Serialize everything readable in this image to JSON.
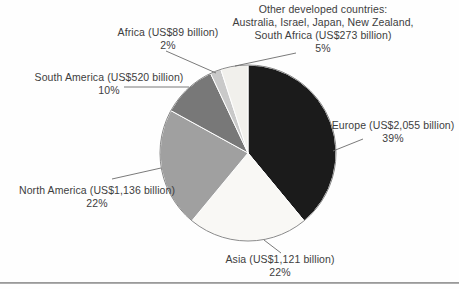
{
  "figure": {
    "background": "#fefefe",
    "text_color": "#3d3d3d",
    "leader_line_color": "#6b6b6b",
    "rim_color": "#7d7d7d",
    "bottom_rule_color": "#9a9a9a"
  },
  "chart_data": {
    "type": "pie",
    "title": "",
    "unit": "US$ billion",
    "start_angle_deg": 0,
    "direction": "clockwise",
    "legend_position": "callout-labels",
    "center": {
      "x": 248,
      "y": 153
    },
    "radius": 88,
    "slices": [
      {
        "id": "europe",
        "name": "Europe",
        "label": "Europe (US$2,055 billion)",
        "pct": "39%",
        "value": 39,
        "amount_usd_billion": 2055,
        "color": "#1b1b1b"
      },
      {
        "id": "asia",
        "name": "Asia",
        "label": "Asia (US$1,121 billion)",
        "pct": "22%",
        "value": 22,
        "amount_usd_billion": 1121,
        "color": "#f9f8f5"
      },
      {
        "id": "north-america",
        "name": "North America",
        "label": "North America (US$1,136 billion)",
        "pct": "22%",
        "value": 22,
        "amount_usd_billion": 1136,
        "color": "#a0a0a0"
      },
      {
        "id": "south-america",
        "name": "South America",
        "label": "South America (US$520 billion)",
        "pct": "10%",
        "value": 10,
        "amount_usd_billion": 520,
        "color": "#787878"
      },
      {
        "id": "africa",
        "name": "Africa",
        "label": "Africa (US$89 billion)",
        "pct": "2%",
        "value": 2,
        "amount_usd_billion": 89,
        "color": "#c9c9c9"
      },
      {
        "id": "other-developed",
        "name": "Other developed countries",
        "label_lines": [
          "Other developed countries:",
          "Australia, Israel, Japan, New Zealand,",
          "South Africa (US$273 billion)"
        ],
        "pct": "5%",
        "value": 5,
        "amount_usd_billion": 273,
        "color": "#f1f0ec"
      }
    ]
  }
}
